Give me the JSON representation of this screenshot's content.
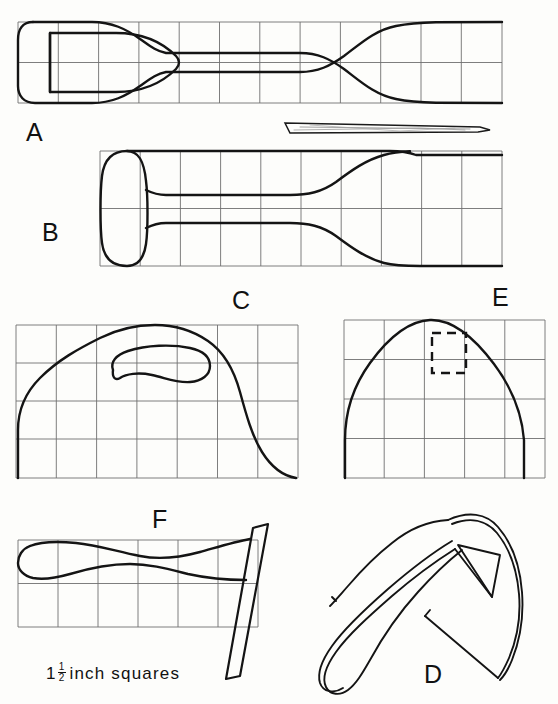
{
  "plate": {
    "title": "Tool pattern plate - six figures over grid",
    "background_color": "#fdfdfb",
    "ink_color": "#111111",
    "grid_color": "#6f6f6f",
    "outline_width_px": 2.4,
    "grid_width_px": 0.9
  },
  "scale_note": {
    "whole": "1",
    "numerator": "1",
    "denominator": "2",
    "unit_text": "inch  squares",
    "full_text": "1 1/2 inch squares"
  },
  "figures": [
    {
      "id": "A",
      "label": "A",
      "name": "spatula-turner-plan-view",
      "description": "Flat spatula blade with open tapered handle eye, seen in plan",
      "grid": {
        "x": 18,
        "y": 22,
        "width": 484,
        "height": 81,
        "cols": 12,
        "rows": 2,
        "cell": 40.3
      }
    },
    {
      "id": "A-edge",
      "label": "",
      "name": "spatula-edge-profile",
      "description": "Thin tapered edge-on profile of the spatula blade",
      "grid": null
    },
    {
      "id": "B",
      "label": "B",
      "name": "cleaver-plan-view",
      "description": "Cleaver blade with looped bolster handle, plan view",
      "grid": {
        "x": 100,
        "y": 151,
        "width": 402,
        "height": 115,
        "cols": 10,
        "rows": 2,
        "cell": 40.2
      }
    },
    {
      "id": "C",
      "label": "C",
      "name": "handled-blade-with-grip-slot",
      "description": "Broad rounded blade with an elongated kidney grip slot",
      "grid": {
        "x": 16,
        "y": 325,
        "width": 282,
        "height": 153,
        "cols": 7,
        "rows": 4,
        "cell": 40.0
      }
    },
    {
      "id": "E",
      "label": "E",
      "name": "dome-blade-with-dashed-tang",
      "description": "Domed blade outline with dashed hidden tang rectangle",
      "grid": {
        "x": 344,
        "y": 320,
        "width": 201,
        "height": 158,
        "cols": 5,
        "rows": 4,
        "cell": 40.2
      }
    },
    {
      "id": "F",
      "label": "F",
      "name": "handle-profile-with-angled-bar",
      "description": "Tapered handle profile with angled stock bar crossing at right",
      "grid": {
        "x": 18,
        "y": 540,
        "width": 240,
        "height": 87,
        "cols": 6,
        "rows": 2,
        "cell": 40.0
      }
    },
    {
      "id": "D",
      "label": "D",
      "name": "perspective-tool-sketch",
      "description": "Three-quarter perspective sketch of the finished tool with handle",
      "grid": null
    }
  ]
}
